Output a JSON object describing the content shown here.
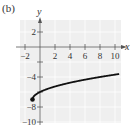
{
  "panel_label": "(b)",
  "colors": {
    "plot_bg": "#efefef",
    "grid": "#ffffff",
    "axis": "#555555",
    "curve": "#111111"
  },
  "chart_data": {
    "type": "line",
    "title": "",
    "xlabel": "x",
    "ylabel": "y",
    "xlim": [
      -3,
      10.8
    ],
    "ylim": [
      -11,
      3
    ],
    "x_ticks": [
      -2,
      2,
      4,
      6,
      8,
      10
    ],
    "x_tick_labels": [
      "-2",
      "2",
      "4",
      "6",
      "8",
      "10"
    ],
    "y_ticks": [
      2,
      -4,
      -8,
      -10
    ],
    "y_tick_labels": [
      "2",
      "-4",
      "-8",
      "-10"
    ],
    "y_tick_marks": [
      2,
      -2,
      -4,
      -6,
      -8,
      -10
    ],
    "x_tick_marks": [
      -2,
      2,
      4,
      6,
      8,
      10
    ],
    "grid": true,
    "series": [
      {
        "name": "f(x)",
        "start_point": {
          "x": -1,
          "y": -7,
          "closed": true
        },
        "x": [
          -1,
          -0.75,
          0,
          1,
          2,
          3,
          4,
          5,
          6,
          7,
          8,
          9,
          10,
          10.5
        ],
        "y": [
          -7,
          -6.5,
          -6,
          -5.59,
          -5.27,
          -5,
          -4.76,
          -4.55,
          -4.35,
          -4.17,
          -4,
          -3.84,
          -3.68,
          -3.61
        ]
      }
    ]
  }
}
